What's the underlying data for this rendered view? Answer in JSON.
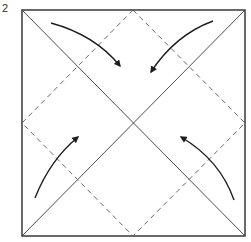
{
  "step": {
    "number": "2"
  },
  "diagram": {
    "type": "origami-fold-step",
    "colors": {
      "outline": "#2a2a2a",
      "crease": "#3a3a3a",
      "fold_line": "#555555",
      "arrow": "#1e1e1e"
    },
    "square": {
      "x1": 22,
      "y1": 10,
      "x2": 245,
      "y2": 236
    },
    "center": {
      "x": 133,
      "y": 123
    },
    "arrows": [
      {
        "name": "top-left-corner-arrow",
        "from": [
          51,
          23
        ],
        "to": [
          120,
          66
        ],
        "ctrl": [
          95,
          35
        ]
      },
      {
        "name": "top-right-corner-arrow",
        "from": [
          213,
          21
        ],
        "to": [
          151,
          72
        ],
        "ctrl": [
          175,
          35
        ]
      },
      {
        "name": "bottom-left-corner-arrow",
        "from": [
          35,
          198
        ],
        "to": [
          78,
          137
        ],
        "ctrl": [
          50,
          160
        ]
      },
      {
        "name": "bottom-right-corner-arrow",
        "from": [
          234,
          200
        ],
        "to": [
          181,
          137
        ],
        "ctrl": [
          220,
          160
        ]
      }
    ]
  }
}
